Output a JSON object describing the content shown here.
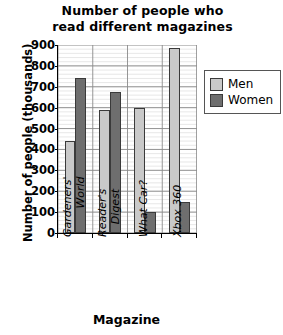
{
  "chart_data": {
    "type": "bar",
    "title": "Number of people who read different magazines",
    "title_line1": "Number of people who",
    "title_line2": "read different magazines",
    "xlabel": "Magazine",
    "ylabel": "Number of people (thousands)",
    "categories": [
      "Gardeners' World",
      "Reader's Digest",
      "What Car?",
      "Xbox 360"
    ],
    "category_lines": [
      [
        "Gardeners'",
        "World"
      ],
      [
        "Reader's",
        "Digest"
      ],
      [
        "What Car?"
      ],
      [
        "Xbox 360"
      ]
    ],
    "series": [
      {
        "name": "Men",
        "color": "#c9c9c9",
        "values": [
          440,
          590,
          600,
          885
        ]
      },
      {
        "name": "Women",
        "color": "#6e6e6e",
        "values": [
          740,
          675,
          100,
          150
        ]
      }
    ],
    "ylim": [
      0,
      900
    ],
    "yticks": [
      0,
      100,
      200,
      300,
      400,
      500,
      600,
      700,
      800,
      900
    ],
    "ytick_labels": [
      "0",
      "100",
      "200",
      "300",
      "400",
      "500",
      "600",
      "700",
      "800",
      "900"
    ],
    "minor_tick_step": 20,
    "grid": true,
    "legend_position": "right",
    "legend_entries": [
      "Men",
      "Women"
    ]
  },
  "colors": {
    "men": "#c9c9c9",
    "women": "#6e6e6e",
    "bar_edge": "#3a3a3a",
    "axis": "#000000",
    "major_grid": "#8a8a8a",
    "minor_grid": "#dcdcdc",
    "legend_border": "#555555",
    "background": "#ffffff"
  }
}
